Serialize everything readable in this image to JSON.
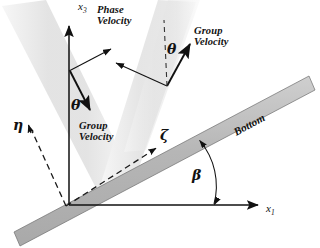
{
  "figure": {
    "type": "schematic-diagram",
    "width": 320,
    "height": 248,
    "background_color": "#ffffff"
  },
  "axes": {
    "horizontal": {
      "label": "x",
      "subscript": "1",
      "origin": [
        69,
        205
      ],
      "tip": [
        265,
        205
      ],
      "color": "#111111"
    },
    "vertical": {
      "label": "x",
      "subscript": "3",
      "origin": [
        69,
        205
      ],
      "tip": [
        69,
        18
      ],
      "color": "#111111"
    },
    "slope_parallel": {
      "label": "ζ",
      "name": "zeta",
      "style": "dashed",
      "tip": [
        157,
        149
      ],
      "color": "#111111"
    },
    "slope_normal": {
      "label": "η",
      "name": "eta",
      "style": "dashed",
      "tip": [
        28,
        124
      ],
      "color": "#111111"
    }
  },
  "angles": {
    "beta": {
      "label": "β",
      "description": "bottom slope angle measured from x1 axis",
      "value_deg": 28
    },
    "theta_left": {
      "label": "θ",
      "description": "angle between vertical and group velocity direction"
    },
    "theta_right": {
      "label": "θ",
      "description": "angle between vertical dashed line and reflected group velocity"
    }
  },
  "labels": {
    "phase_velocity": {
      "line1": "Phase",
      "line2": "Velocity"
    },
    "group_velocity_left": {
      "line1": "Group",
      "line2": "Velocity"
    },
    "group_velocity_right": {
      "line1": "Group",
      "line2": "Velocity"
    },
    "bottom": "Bottom"
  },
  "colors": {
    "bottom_band_fill": "#b8b8b8",
    "bottom_band_stroke": "#6f6f6f",
    "beam_fill": "#e9e9e9",
    "line": "#111111",
    "dashed": "#444444",
    "text": "#111111"
  },
  "beams": [
    {
      "name": "incident-beam-left",
      "description": "light gray wave beam descending from upper left toward the slope"
    },
    {
      "name": "reflected-beam-center",
      "description": "light gray wave beam ascending from reflection point toward upper right"
    },
    {
      "name": "incident-beam-right",
      "description": "light gray wave beam descending from upper right toward the slope"
    }
  ],
  "vectors": [
    {
      "name": "phase-velocity-arrow-left",
      "from": [
        69,
        70
      ],
      "to": [
        115,
        46
      ],
      "kind": "phase"
    },
    {
      "name": "group-velocity-arrow-left",
      "from": [
        69,
        70
      ],
      "to": [
        94,
        117
      ],
      "kind": "group"
    },
    {
      "name": "phase-velocity-arrow-right",
      "from": [
        167,
        86
      ],
      "to": [
        113,
        62
      ],
      "kind": "phase"
    },
    {
      "name": "group-velocity-arrow-right",
      "from": [
        167,
        86
      ],
      "to": [
        194,
        38
      ],
      "kind": "group"
    }
  ]
}
